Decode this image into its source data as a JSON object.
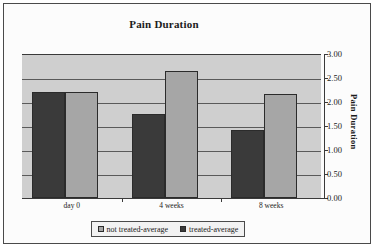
{
  "chart_data": {
    "type": "bar",
    "title": "Pain Duration",
    "xlabel": "",
    "ylabel": "Pain Duration",
    "categories": [
      "day 0",
      "4 weeks",
      "8 weeks"
    ],
    "series": [
      {
        "name": "treated-average",
        "values": [
          2.2,
          1.75,
          1.42
        ],
        "color": "#3a3a3a"
      },
      {
        "name": "not treated-average",
        "values": [
          2.2,
          2.65,
          2.17
        ],
        "color": "#a6a6a6"
      }
    ],
    "ylim": [
      0.0,
      3.0
    ],
    "ytick_labels": [
      "3.00",
      "2.50",
      "2.00",
      "1.50",
      "1.00",
      "0.50",
      "0.00"
    ],
    "ytick_values": [
      3.0,
      2.5,
      2.0,
      1.5,
      1.0,
      0.5,
      0.0
    ],
    "grid": true,
    "axis_position": "right",
    "legend_position": "bottom",
    "legend_entries": [
      {
        "label": "not treated-average",
        "swatch": "light"
      },
      {
        "label": "treated-average",
        "swatch": "dark"
      }
    ],
    "plot_background": "#cfcfcf"
  }
}
